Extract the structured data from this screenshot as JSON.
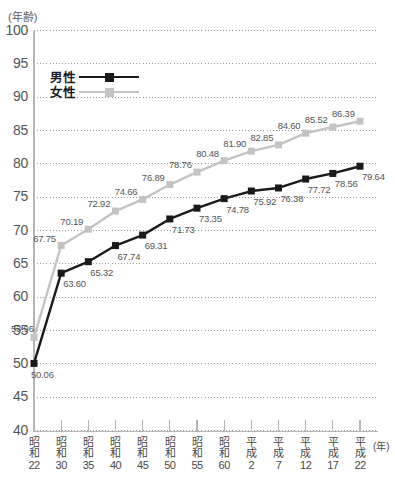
{
  "axis_unit_label": "(年齢)",
  "x_unit_label": "(年)",
  "legend": {
    "male": "男性",
    "female": "女性"
  },
  "colors": {
    "male_line": "#1a1a1a",
    "female_line": "#c3c3c3",
    "grid": "#9a9a9a",
    "axis": "#b5b5b5",
    "label_text": "#555555"
  },
  "chart_data": {
    "type": "line",
    "title": "",
    "subtitle": "",
    "xlabel": "(年)",
    "ylabel": "(年齢)",
    "ylim": [
      40,
      100
    ],
    "ytick_step": 5,
    "grid": true,
    "legend_position": "top-left",
    "yticks": [
      100,
      95,
      90,
      85,
      80,
      75,
      70,
      65,
      60,
      55,
      50,
      45,
      40
    ],
    "categories": [
      "昭和22",
      "昭和30",
      "昭和35",
      "昭和40",
      "昭和45",
      "昭和50",
      "昭和55",
      "昭和60",
      "平成2",
      "平成7",
      "平成12",
      "平成17",
      "平成22"
    ],
    "category_lines": [
      [
        "昭",
        "和",
        "22"
      ],
      [
        "昭",
        "和",
        "30"
      ],
      [
        "昭",
        "和",
        "35"
      ],
      [
        "昭",
        "和",
        "40"
      ],
      [
        "昭",
        "和",
        "45"
      ],
      [
        "昭",
        "和",
        "50"
      ],
      [
        "昭",
        "和",
        "55"
      ],
      [
        "昭",
        "和",
        "60"
      ],
      [
        "平",
        "成",
        "2"
      ],
      [
        "平",
        "成",
        "7"
      ],
      [
        "平",
        "成",
        "12"
      ],
      [
        "平",
        "成",
        "17"
      ],
      [
        "平",
        "成",
        "22"
      ]
    ],
    "series": [
      {
        "name": "男性",
        "color": "#1a1a1a",
        "label_position": "below-right",
        "values": [
          50.06,
          63.6,
          65.32,
          67.74,
          69.31,
          71.73,
          73.35,
          74.78,
          75.92,
          76.38,
          77.72,
          78.56,
          79.64
        ]
      },
      {
        "name": "女性",
        "color": "#c3c3c3",
        "label_position": "above-left",
        "values": [
          53.96,
          67.75,
          70.19,
          72.92,
          74.66,
          76.89,
          78.76,
          80.48,
          81.9,
          82.85,
          84.6,
          85.52,
          86.39
        ]
      }
    ]
  }
}
